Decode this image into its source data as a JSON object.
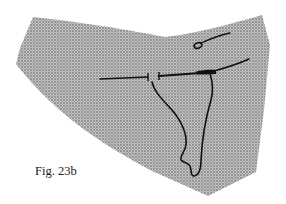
{
  "figure": {
    "caption": "Fig. 23b",
    "fabric_color": "#a9a9a9",
    "fabric_dot_color": "#8c8c8c",
    "thread_color": "#111111",
    "background_color": "#ffffff"
  }
}
